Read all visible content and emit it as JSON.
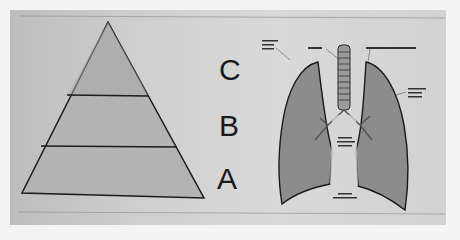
{
  "diagram": {
    "pyramid": {
      "levels": 3,
      "labels": [
        "C",
        "B",
        "A"
      ]
    },
    "lungs": {
      "description": "illustration of lungs with trachea and bronchi",
      "annotations": [
        "illegible label",
        "illegible label",
        "illegible label",
        "illegible label",
        "illegible label",
        "illegible label"
      ]
    }
  }
}
